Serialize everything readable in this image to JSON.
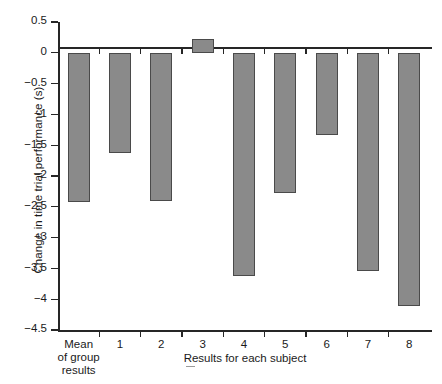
{
  "chart_data": {
    "type": "bar",
    "title": "",
    "xlabel": "Results for each subject",
    "ylabel": "Change in time trial performance (s)",
    "categories": [
      "Mean\nof group\nresults",
      "1",
      "2",
      "3",
      "4",
      "5",
      "6",
      "7",
      "8"
    ],
    "values": [
      -2.42,
      -1.62,
      -2.4,
      0.22,
      -3.62,
      -2.28,
      -1.33,
      -3.55,
      -4.11
    ],
    "ylim": [
      -4.5,
      0.5
    ],
    "ytick_labels": [
      "0.5",
      "0",
      "-0.5",
      "-1",
      "-1.5",
      "-2",
      "-2.5",
      "-3",
      "-3.5",
      "-4",
      "-4.5"
    ],
    "ytick_values": [
      0.5,
      0,
      -0.5,
      -1,
      -1.5,
      -2,
      -2.5,
      -3,
      -3.5,
      -4,
      -4.5
    ],
    "grid": false,
    "legend": "none",
    "bar_fill_color": "#8a8a8a",
    "bar_edge_color": "#4a4a4a",
    "axis_color": "#262626"
  },
  "axes": {
    "y_title": "Change in time trial performance (s)",
    "x_title": "Results for each subject"
  }
}
